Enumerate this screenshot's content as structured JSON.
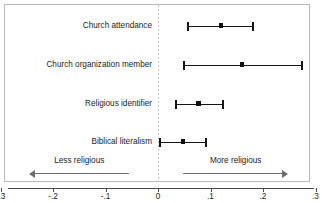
{
  "chart_data": {
    "type": "scatter",
    "title": "",
    "subtitle": "",
    "xlabel": "",
    "ylabel": "",
    "xlim": [
      -0.3,
      0.3
    ],
    "grid": false,
    "legend_position": "none",
    "zero_reference_line": 0,
    "xticks": [
      -0.3,
      -0.2,
      -0.1,
      0,
      0.1,
      0.2,
      0.3
    ],
    "xtick_labels": [
      "-.3",
      "-.2",
      "-.1",
      "0",
      ".1",
      ".2",
      ".3"
    ],
    "categories": [
      "Church attendance",
      "Church organization member",
      "Religious identifier",
      "Biblical literalism"
    ],
    "series": [
      {
        "name": "Coefficient estimate with 95% CI",
        "points": [
          {
            "label": "Church attendance",
            "estimate": 0.12,
            "ci_low": 0.057,
            "ci_high": 0.181
          },
          {
            "label": "Church organization member",
            "estimate": 0.16,
            "ci_low": 0.05,
            "ci_high": 0.274
          },
          {
            "label": "Religious identifier",
            "estimate": 0.077,
            "ci_low": 0.034,
            "ci_high": 0.124
          },
          {
            "label": "Biblical literalism",
            "estimate": 0.048,
            "ci_low": 0.004,
            "ci_high": 0.091
          }
        ]
      }
    ],
    "annotations": [
      {
        "text": "Less religious",
        "direction": "left",
        "from": -0.055,
        "to": -0.245
      },
      {
        "text": "More religious",
        "direction": "right",
        "from": 0.048,
        "to": 0.248
      }
    ],
    "colors": {
      "marker": "#111111",
      "interval": "#151515",
      "zero_line": "#c4c4c4",
      "frame": "#b9b9b9",
      "axis": "#4a4a4a",
      "annotation_arrow": "#6d6d6d",
      "background": "#ffffff"
    }
  }
}
